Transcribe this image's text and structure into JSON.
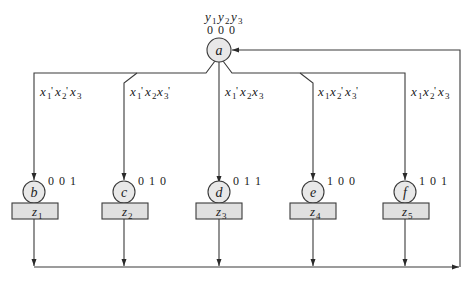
{
  "diagram": {
    "type": "state-diagram",
    "header_label": "y1y2y3",
    "initial_state": {
      "id": "a",
      "code": "0 0 0"
    },
    "states": [
      {
        "id": "b",
        "code": "0 0 1",
        "output": "z1",
        "condition": "x1'x2'x3"
      },
      {
        "id": "c",
        "code": "0 1 0",
        "output": "z2",
        "condition": "x1'x2x3'"
      },
      {
        "id": "d",
        "code": "0 1 1",
        "output": "z3",
        "condition": "x1'x2x3"
      },
      {
        "id": "e",
        "code": "1 0 0",
        "output": "z4",
        "condition": "x1x2'x3'"
      },
      {
        "id": "f",
        "code": "1 0 1",
        "output": "z5",
        "condition": "x1x2'x3"
      }
    ],
    "feedback": "all outputs return to state a",
    "colors": {
      "line": "#3a3a3a",
      "node_fill": "#e8e8e8",
      "box_fill": "#e0e0e0",
      "background": "#ffffff"
    }
  }
}
